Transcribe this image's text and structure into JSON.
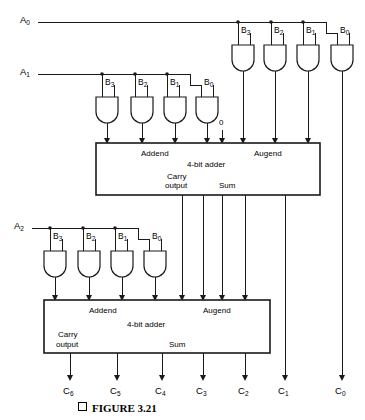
{
  "figure": {
    "caption": "FIGURE 3.21",
    "type": "logic-circuit-diagram"
  },
  "inputs": {
    "a_labels": [
      "A0",
      "A1",
      "A2"
    ],
    "b_labels": [
      "B3",
      "B2",
      "B1",
      "B0"
    ],
    "constant_zero": "0"
  },
  "rows": [
    {
      "name": "row-a0",
      "a_label": "A0",
      "b_labels": [
        "B3",
        "B2",
        "B1",
        "B0"
      ]
    },
    {
      "name": "row-a1",
      "a_label": "A1",
      "b_labels": [
        "B3",
        "B2",
        "B1",
        "B0"
      ]
    },
    {
      "name": "row-a2",
      "a_label": "A2",
      "b_labels": [
        "B3",
        "B2",
        "B1",
        "B0"
      ]
    }
  ],
  "adders": [
    {
      "name": "adder-1",
      "title": "4-bit adder",
      "addend_label": "Addend",
      "augend_label": "Augend",
      "carry_label_line1": "Carry",
      "carry_label_line2": "output",
      "sum_label": "Sum"
    },
    {
      "name": "adder-2",
      "title": "4-bit adder",
      "addend_label": "Addend",
      "augend_label": "Augend",
      "carry_label_line1": "Carry",
      "carry_label_line2": "output",
      "sum_label": "Sum"
    }
  ],
  "outputs": {
    "labels": [
      "C6",
      "C5",
      "C4",
      "C3",
      "C2",
      "C1",
      "C0"
    ]
  },
  "colors": {
    "line": "#1a1a1a",
    "background": "#ffffff",
    "text": "#000000"
  }
}
